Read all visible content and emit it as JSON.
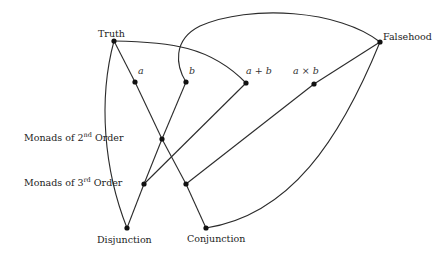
{
  "diagram": {
    "type": "lattice / Hasse-style diagram",
    "background": "#ffffff",
    "line_color": "#2b2b2b",
    "node_color": "#111111",
    "nodes": [
      {
        "id": "truth",
        "label": "Truth",
        "x": 114,
        "y": 41
      },
      {
        "id": "a",
        "label": "a",
        "x": 135,
        "y": 82
      },
      {
        "id": "b",
        "label": "b",
        "x": 186,
        "y": 82
      },
      {
        "id": "a_plus_b",
        "label": "a + b",
        "x": 246,
        "y": 83
      },
      {
        "id": "a_times_b",
        "label": "a × b",
        "x": 314,
        "y": 84
      },
      {
        "id": "falsehood",
        "label": "Falsehood",
        "x": 380,
        "y": 42
      },
      {
        "id": "second_order",
        "label": "",
        "x": 162,
        "y": 139
      },
      {
        "id": "third_order_left",
        "label": "",
        "x": 144,
        "y": 184
      },
      {
        "id": "third_order_right",
        "label": "",
        "x": 186,
        "y": 184
      },
      {
        "id": "disjunction",
        "label": "Disjunction",
        "x": 127,
        "y": 228
      },
      {
        "id": "conjunction",
        "label": "Conjunction",
        "x": 206,
        "y": 228
      }
    ],
    "row_labels": [
      {
        "id": "monads_2nd",
        "prefix": "Monads of 2",
        "sup": "nd",
        "suffix": " Order"
      },
      {
        "id": "monads_3rd",
        "prefix": "Monads of 3",
        "sup": "rd",
        "suffix": " Order"
      }
    ],
    "edges": [
      {
        "from": "truth",
        "to": "a",
        "shape": "straight"
      },
      {
        "from": "a",
        "to": "second_order",
        "shape": "straight"
      },
      {
        "from": "second_order",
        "to": "third_order_right",
        "shape": "straight"
      },
      {
        "from": "third_order_right",
        "to": "conjunction",
        "shape": "straight"
      },
      {
        "from": "b",
        "to": "second_order",
        "shape": "straight"
      },
      {
        "from": "second_order",
        "to": "third_order_left",
        "shape": "straight"
      },
      {
        "from": "third_order_left",
        "to": "disjunction",
        "shape": "straight"
      },
      {
        "from": "a_plus_b",
        "to": "third_order_left",
        "shape": "straight"
      },
      {
        "from": "a_times_b",
        "to": "third_order_right",
        "shape": "straight"
      },
      {
        "from": "a_times_b",
        "to": "falsehood",
        "shape": "straight"
      },
      {
        "from": "truth",
        "to": "disjunction",
        "shape": "curve"
      },
      {
        "from": "truth",
        "to": "a_plus_b",
        "shape": "curve"
      },
      {
        "from": "b",
        "to": "falsehood",
        "shape": "curve"
      },
      {
        "from": "falsehood",
        "to": "conjunction",
        "shape": "curve"
      }
    ]
  }
}
